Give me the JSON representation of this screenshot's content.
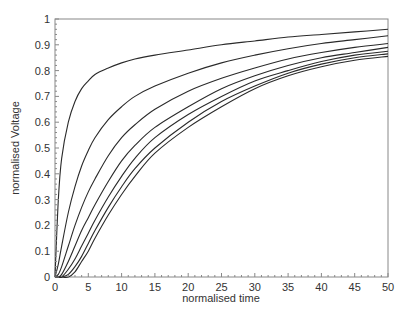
{
  "chart_data": {
    "type": "line",
    "title": "",
    "xlabel": "normalised time",
    "ylabel": "normalised Voltage",
    "xlim": [
      0,
      50
    ],
    "ylim": [
      0,
      1
    ],
    "grid": false,
    "legend": null,
    "x_ticks": [
      0,
      5,
      10,
      15,
      20,
      25,
      30,
      35,
      40,
      45,
      50
    ],
    "y_ticks": [
      0,
      0.1,
      0.2,
      0.3,
      0.4,
      0.5,
      0.6,
      0.7,
      0.8,
      0.9,
      1
    ],
    "x_tick_labels": [
      "0",
      "5",
      "10",
      "15",
      "20",
      "25",
      "30",
      "35",
      "40",
      "45",
      "50"
    ],
    "y_tick_labels": [
      "0",
      "0.1",
      "0.2",
      "0.3",
      "0.4",
      "0.5",
      "0.6",
      "0.7",
      "0.8",
      "0.9",
      "1"
    ],
    "x": [
      0,
      0.5,
      1,
      2,
      3,
      4,
      5,
      6,
      8,
      10,
      12,
      15,
      20,
      25,
      30,
      35,
      40,
      45,
      50
    ],
    "series": [
      {
        "name": "curve 1",
        "values": [
          0,
          0.3,
          0.46,
          0.6,
          0.68,
          0.73,
          0.76,
          0.785,
          0.81,
          0.83,
          0.845,
          0.86,
          0.88,
          0.9,
          0.915,
          0.93,
          0.94,
          0.95,
          0.96
        ]
      },
      {
        "name": "curve 2",
        "values": [
          0,
          0.05,
          0.12,
          0.25,
          0.35,
          0.43,
          0.49,
          0.54,
          0.61,
          0.66,
          0.7,
          0.74,
          0.79,
          0.83,
          0.86,
          0.885,
          0.905,
          0.92,
          0.935
        ]
      },
      {
        "name": "curve 3",
        "values": [
          0,
          0.01,
          0.04,
          0.12,
          0.2,
          0.27,
          0.33,
          0.38,
          0.47,
          0.54,
          0.59,
          0.65,
          0.72,
          0.77,
          0.81,
          0.845,
          0.87,
          0.89,
          0.905
        ]
      },
      {
        "name": "curve 4",
        "values": [
          0,
          0.0,
          0.01,
          0.06,
          0.12,
          0.18,
          0.23,
          0.28,
          0.37,
          0.45,
          0.51,
          0.58,
          0.66,
          0.73,
          0.78,
          0.82,
          0.85,
          0.87,
          0.89
        ]
      },
      {
        "name": "curve 5",
        "values": [
          0,
          0.0,
          0.0,
          0.03,
          0.07,
          0.12,
          0.17,
          0.22,
          0.31,
          0.39,
          0.46,
          0.54,
          0.63,
          0.7,
          0.76,
          0.8,
          0.835,
          0.86,
          0.875
        ]
      },
      {
        "name": "curve 6",
        "values": [
          0,
          0.0,
          0.0,
          0.01,
          0.04,
          0.08,
          0.13,
          0.18,
          0.27,
          0.35,
          0.42,
          0.5,
          0.6,
          0.68,
          0.74,
          0.79,
          0.825,
          0.85,
          0.865
        ]
      },
      {
        "name": "curve 7",
        "values": [
          0,
          0.0,
          0.0,
          0.0,
          0.02,
          0.06,
          0.1,
          0.15,
          0.24,
          0.32,
          0.39,
          0.48,
          0.58,
          0.66,
          0.73,
          0.78,
          0.815,
          0.84,
          0.855
        ]
      }
    ],
    "line_color": "#2a2a2a",
    "axis_color": "#888888"
  }
}
